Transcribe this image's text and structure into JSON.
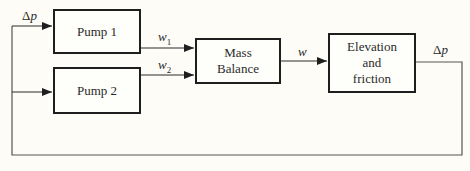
{
  "diagram": {
    "type": "block-diagram",
    "blocks": [
      {
        "id": "pump1",
        "label": "Pump 1"
      },
      {
        "id": "pump2",
        "label": "Pump 2"
      },
      {
        "id": "mass_balance",
        "label": "Mass\nBalance"
      },
      {
        "id": "elevation_friction",
        "label": "Elevation\nand\nfriction"
      }
    ],
    "signals": {
      "delta_p_in": {
        "symbol": "Δ",
        "var": "p"
      },
      "w1": {
        "var": "w",
        "sub": "1"
      },
      "w2": {
        "var": "w",
        "sub": "2"
      },
      "w": {
        "var": "w"
      },
      "delta_p_out": {
        "symbol": "Δ",
        "var": "p"
      }
    },
    "edges": [
      {
        "from": "feedback",
        "to": "pump1",
        "label": "Δp"
      },
      {
        "from": "feedback",
        "to": "pump2"
      },
      {
        "from": "pump1",
        "to": "mass_balance",
        "label": "w1"
      },
      {
        "from": "pump2",
        "to": "mass_balance",
        "label": "w2"
      },
      {
        "from": "mass_balance",
        "to": "elevation_friction",
        "label": "w"
      },
      {
        "from": "elevation_friction",
        "to": "feedback",
        "label": "Δp"
      }
    ],
    "colors": {
      "line": "#2a2a2a",
      "border": "#1e1e1e",
      "background": "#fdfcf7"
    }
  }
}
